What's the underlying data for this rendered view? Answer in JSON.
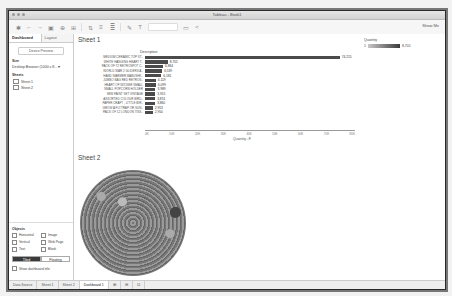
{
  "window": {
    "title": "Tableau - Book1"
  },
  "toolbar": {
    "show_me": "Show Me"
  },
  "left_panel": {
    "tabs": [
      {
        "label": "Dashboard",
        "active": true
      },
      {
        "label": "Layout",
        "active": false
      }
    ],
    "device_preview": "Device Preview",
    "size_label": "Size",
    "size_value": "Desktop Browser (1000 x 8... ▾",
    "sheets_label": "Sheets",
    "sheets": [
      "Sheet 1",
      "Sheet 2"
    ],
    "objects_label": "Objects",
    "objects": [
      "Horizontal",
      "Image",
      "Vertical",
      "Web Page",
      "Text",
      "Blank"
    ],
    "tiled": "Tiled",
    "floating": "Floating",
    "show_title": "Show dashboard title"
  },
  "sheet1": {
    "title": "Sheet 1",
    "column_header": "Description",
    "axis_title": "Quantity ↓F",
    "legend": {
      "title": "Quantity",
      "min": "1",
      "max": "8,701"
    }
  },
  "sheet2": {
    "title": "Sheet 2"
  },
  "bottom_tabs": [
    "Data Source",
    "Sheet 1",
    "Sheet 2",
    "Dashboard 1"
  ],
  "chart_data": {
    "type": "bar",
    "title": "Sheet 1",
    "xlabel": "Quantity",
    "ylabel": "Description",
    "categories": [
      "MEDIUM CERAMIC TOP ST..",
      "WHITE HANGING HEART T..",
      "PACK OF 72 RETROSPOT C..",
      "WORLD WAR 2 GLIDERS A..",
      "HAND WARMER BABUSHK..",
      "JUMBO BAG RED RETROS..",
      "HEART OF WICKER SMALL",
      "SMALL POPCORN HOLDER",
      "MINI PAINT SET VINTAGE",
      "ASSORTED COLOUR BIRD..",
      "PAPER CRAFT , LITTLE BIR..",
      "GROW A FLYTRAP OR SUN..",
      "PACK OF 12 LONDON TISS.."
    ],
    "values": [
      74215,
      8701,
      6864,
      6539,
      6181,
      4119,
      4099,
      3989,
      3915,
      3874,
      3860,
      2953,
      2950
    ],
    "labels": [
      "74,215",
      "8,701",
      "6,864",
      "6,539",
      "6,181",
      "4,119",
      "4,099",
      "3,989",
      "3,915",
      "3,874",
      "3,860",
      "2,953",
      "2,950"
    ],
    "xticks": [
      "0K",
      "10K",
      "20K",
      "30K",
      "40K",
      "50K",
      "60K",
      "70K",
      "80K"
    ],
    "xlim": [
      0,
      80000
    ]
  }
}
